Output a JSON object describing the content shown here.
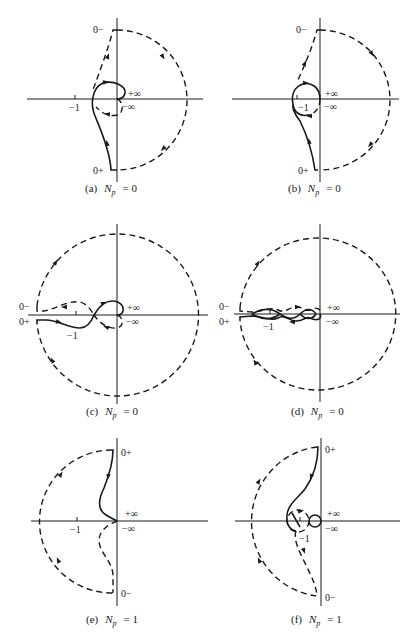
{
  "figure": {
    "panels": [
      {
        "id": "a",
        "caption_prefix": "(a)",
        "caption_var": "N",
        "caption_sub": "p",
        "caption_rest": "= 0",
        "labels": {
          "top": "0−",
          "bottom": "0+",
          "pos_inf": "+∞",
          "neg_inf": "−∞",
          "minus_one": "−1"
        }
      },
      {
        "id": "b",
        "caption_prefix": "(b)",
        "caption_var": "N",
        "caption_sub": "p",
        "caption_rest": "= 0",
        "labels": {
          "top": "0−",
          "bottom": "0+",
          "pos_inf": "+∞",
          "neg_inf": "−∞",
          "minus_one": "−1"
        }
      },
      {
        "id": "c",
        "caption_prefix": "(c)",
        "caption_var": "N",
        "caption_sub": "p",
        "caption_rest": "= 0",
        "labels": {
          "top": "0−",
          "bottom": "0+",
          "pos_inf": "+∞",
          "neg_inf": "−∞",
          "minus_one": "−1"
        }
      },
      {
        "id": "d",
        "caption_prefix": "(d)",
        "caption_var": "N",
        "caption_sub": "p",
        "caption_rest": "= 0",
        "labels": {
          "top": "0−",
          "bottom": "0+",
          "pos_inf": "+∞",
          "neg_inf": "−∞",
          "minus_one": "−1"
        }
      },
      {
        "id": "e",
        "caption_prefix": "(e)",
        "caption_var": "N",
        "caption_sub": "p",
        "caption_rest": "= 1",
        "labels": {
          "top": "0+",
          "bottom": "0−",
          "pos_inf": "+∞",
          "neg_inf": "−∞",
          "minus_one": "−1"
        }
      },
      {
        "id": "f",
        "caption_prefix": "(f)",
        "caption_var": "N",
        "caption_sub": "p",
        "caption_rest": "= 1",
        "labels": {
          "top": "0+",
          "bottom": "0−",
          "pos_inf": "+∞",
          "neg_inf": "−∞",
          "minus_one": "−1"
        }
      }
    ]
  },
  "colors": {
    "ink": "#1a1a1a",
    "background": "#ffffff"
  }
}
